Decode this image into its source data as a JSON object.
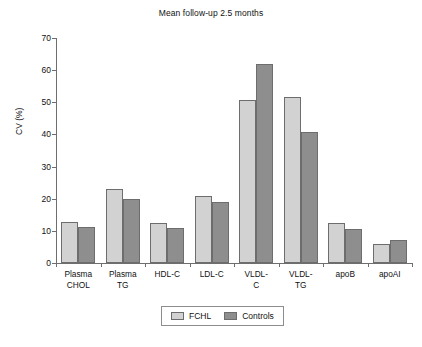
{
  "chart_data": {
    "type": "bar",
    "title": "Mean follow-up 2.5 months",
    "xlabel": "",
    "ylabel": "CV (%)",
    "ylim": [
      0,
      70
    ],
    "ytick_step": 10,
    "yticks": [
      0,
      10,
      20,
      30,
      40,
      50,
      60,
      70
    ],
    "grid": false,
    "legend_position": "bottom-center",
    "categories": [
      "Plasma\nCHOL",
      "Plasma\nTG",
      "HDL-C",
      "LDL-C",
      "VLDL-\nC",
      "VLDL-\nTG",
      "apoB",
      "apoAI"
    ],
    "series": [
      {
        "name": "FCHL",
        "color": "#d2d2d2",
        "values": [
          12.8,
          23.0,
          12.6,
          20.9,
          50.7,
          51.8,
          12.3,
          6.0
        ]
      },
      {
        "name": "Controls",
        "color": "#8e8e8e",
        "values": [
          11.2,
          20.0,
          11.0,
          19.0,
          61.8,
          40.7,
          10.6,
          7.2
        ]
      }
    ]
  },
  "legend": {
    "entries": [
      {
        "label": "FCHL"
      },
      {
        "label": "Controls"
      }
    ]
  },
  "caption": {
    "partial_text": ""
  }
}
